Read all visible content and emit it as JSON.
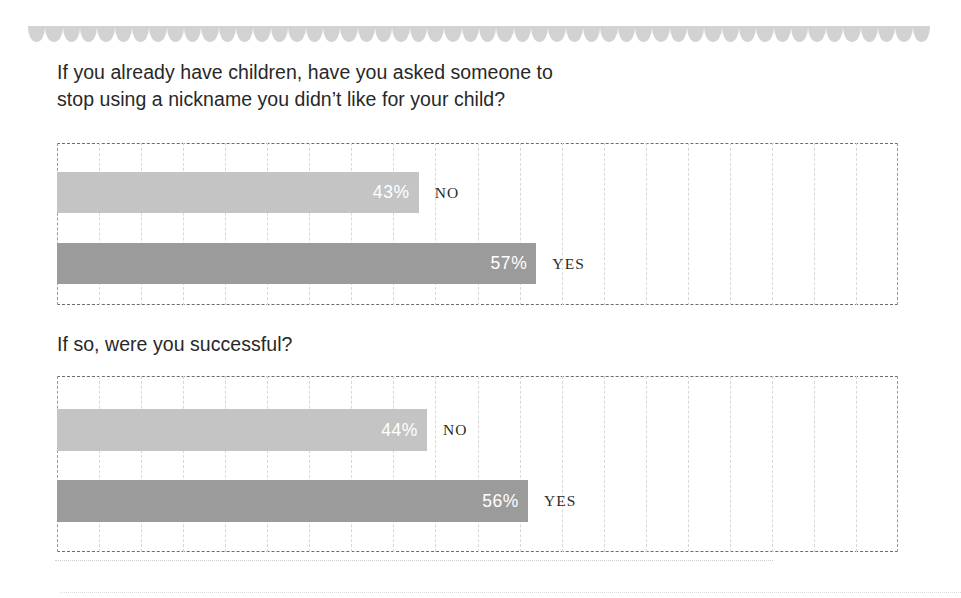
{
  "page": {
    "background_color": "#ffffff",
    "text_color": "#282828"
  },
  "decoration": {
    "top_border": {
      "name": "scalloped-border",
      "shape": "scallop",
      "count": 52,
      "color": "#d2d2d2",
      "line_color": "#d4d4d4"
    },
    "bottom_rule_color": "#cfcfcf"
  },
  "colors": {
    "bar_no": "#c4c4c4",
    "bar_yes": "#9b9b9b",
    "value_text": "#ffffff",
    "frame_dash": "#6d6d6d",
    "gridline": "#d8d8d8"
  },
  "sections": [
    {
      "id": "section-1",
      "question": "If you already have children, have you asked someone to\nstop using a nickname you didn’t like for your child?",
      "rows": [
        {
          "label": "NO",
          "value_text": "43%",
          "value": 43,
          "color": "#c4c4c4"
        },
        {
          "label": "YES",
          "value_text": "57%",
          "value": 57,
          "color": "#9b9b9b"
        }
      ]
    },
    {
      "id": "section-2",
      "question": "If so, were you successful?",
      "rows": [
        {
          "label": "NO",
          "value_text": "44%",
          "value": 44,
          "color": "#c4c4c4"
        },
        {
          "label": "YES",
          "value_text": "56%",
          "value": 56,
          "color": "#9b9b9b"
        }
      ]
    }
  ],
  "chart_data": [
    {
      "type": "bar",
      "orientation": "horizontal",
      "title": "If you already have children, have you asked someone to stop using a nickname you didn’t like for your child?",
      "categories": [
        "NO",
        "YES"
      ],
      "values": [
        43,
        57
      ],
      "data_labels": [
        "43%",
        "57%"
      ],
      "xlabel": "",
      "ylabel": "",
      "xlim": [
        0,
        100
      ],
      "grid": true,
      "gridline_interval": 5,
      "legend": "none",
      "unit": "percent",
      "series_colors": [
        "#c4c4c4",
        "#9b9b9b"
      ]
    },
    {
      "type": "bar",
      "orientation": "horizontal",
      "title": "If so, were you successful?",
      "categories": [
        "NO",
        "YES"
      ],
      "values": [
        44,
        56
      ],
      "data_labels": [
        "44%",
        "56%"
      ],
      "xlabel": "",
      "ylabel": "",
      "xlim": [
        0,
        100
      ],
      "grid": true,
      "gridline_interval": 5,
      "legend": "none",
      "unit": "percent",
      "series_colors": [
        "#c4c4c4",
        "#9b9b9b"
      ]
    }
  ]
}
